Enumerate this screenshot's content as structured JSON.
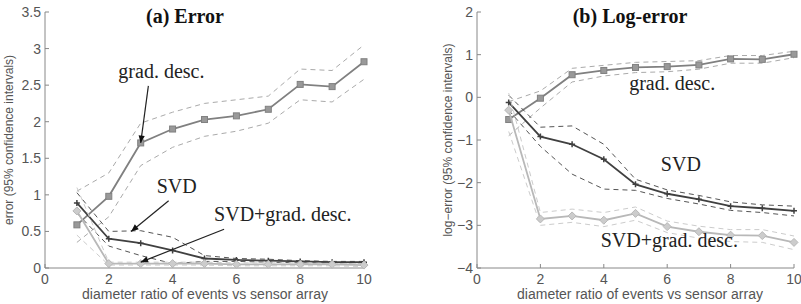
{
  "chart_data": [
    {
      "type": "line",
      "title": "(a) Error",
      "xlabel": "diameter ratio of events vs sensor array",
      "ylabel": "error (95% confidence intervals)",
      "xlim": [
        0,
        10
      ],
      "ylim": [
        0,
        3.5
      ],
      "xticks": [
        "0",
        "2",
        "4",
        "6",
        "8",
        "10"
      ],
      "yticks": [
        "0",
        "0.5",
        "1",
        "1.5",
        "2",
        "2.5",
        "3",
        "3.5"
      ],
      "grid": false,
      "x": [
        1,
        2,
        3,
        4,
        5,
        6,
        7,
        8,
        9,
        10
      ],
      "series": [
        {
          "name": "grad. desc.",
          "marker": "square",
          "color": "#808080",
          "values": [
            0.59,
            0.98,
            1.71,
            1.9,
            2.03,
            2.08,
            2.17,
            2.51,
            2.48,
            2.82
          ],
          "ci_upper": [
            1.05,
            1.3,
            1.98,
            2.13,
            2.25,
            2.3,
            2.35,
            2.72,
            2.7,
            3.05
          ],
          "ci_lower": [
            0.35,
            0.7,
            1.4,
            1.65,
            1.8,
            1.87,
            1.98,
            2.3,
            2.27,
            2.58
          ]
        },
        {
          "name": "SVD",
          "marker": "plus",
          "color": "#404040",
          "values": [
            0.89,
            0.4,
            0.34,
            0.24,
            0.13,
            0.11,
            0.1,
            0.09,
            0.08,
            0.08
          ],
          "ci_upper": [
            1.03,
            0.5,
            0.51,
            0.42,
            0.17,
            0.13,
            0.12,
            0.1,
            0.09,
            0.09
          ],
          "ci_lower": [
            0.75,
            0.3,
            0.17,
            0.06,
            0.09,
            0.09,
            0.08,
            0.07,
            0.07,
            0.07
          ]
        },
        {
          "name": "SVD+grad. desc.",
          "marker": "diamond",
          "color": "#b8b8b8",
          "values": [
            0.78,
            0.06,
            0.06,
            0.06,
            0.06,
            0.05,
            0.05,
            0.05,
            0.05,
            0.04
          ],
          "ci_upper": [
            1.1,
            0.08,
            0.08,
            0.08,
            0.08,
            0.07,
            0.07,
            0.07,
            0.06,
            0.06
          ],
          "ci_lower": [
            0.45,
            0.04,
            0.04,
            0.04,
            0.04,
            0.03,
            0.03,
            0.03,
            0.03,
            0.02
          ]
        }
      ],
      "annotations": [
        {
          "text": "grad. desc.",
          "x": 2.3,
          "y": 2.6,
          "arrow_to": [
            3,
            1.71
          ]
        },
        {
          "text": "SVD",
          "x": 3.5,
          "y": 1.03,
          "arrow_to": [
            2.7,
            0.5
          ]
        },
        {
          "text": "SVD+grad. desc.",
          "x": 5.3,
          "y": 0.64,
          "arrow_to": [
            3,
            0.08
          ]
        }
      ]
    },
    {
      "type": "line",
      "title": "(b) Log-error",
      "xlabel": "diameter ratio of events vs sensor array",
      "ylabel": "log−error (95% confidence intervals)",
      "xlim": [
        0,
        10
      ],
      "ylim": [
        -4,
        2
      ],
      "xticks": [
        "0",
        "2",
        "4",
        "6",
        "8",
        "10"
      ],
      "yticks": [
        "−4",
        "−3",
        "−2",
        "−1",
        "0",
        "1",
        "2"
      ],
      "grid": false,
      "x": [
        1,
        2,
        3,
        4,
        5,
        6,
        7,
        8,
        9,
        10
      ],
      "series": [
        {
          "name": "grad. desc.",
          "marker": "square",
          "color": "#808080",
          "values": [
            -0.52,
            -0.02,
            0.53,
            0.63,
            0.7,
            0.72,
            0.76,
            0.9,
            0.89,
            1.01
          ],
          "ci_upper": [
            -0.1,
            0.15,
            0.68,
            0.75,
            0.82,
            0.84,
            0.86,
            0.98,
            0.98,
            1.08
          ],
          "ci_lower": [
            -0.9,
            -0.25,
            0.36,
            0.5,
            0.58,
            0.6,
            0.66,
            0.8,
            0.8,
            0.93
          ]
        },
        {
          "name": "SVD",
          "marker": "plus",
          "color": "#404040",
          "values": [
            -0.12,
            -0.92,
            -1.1,
            -1.45,
            -2.04,
            -2.26,
            -2.39,
            -2.55,
            -2.6,
            -2.66
          ],
          "ci_upper": [
            0.05,
            -0.7,
            -0.67,
            -1.1,
            -1.92,
            -2.17,
            -2.3,
            -2.45,
            -2.52,
            -2.55
          ],
          "ci_lower": [
            -0.3,
            -1.15,
            -1.8,
            -2.15,
            -2.18,
            -2.37,
            -2.5,
            -2.65,
            -2.7,
            -2.78
          ]
        },
        {
          "name": "SVD+grad. desc.",
          "marker": "diamond",
          "color": "#b8b8b8",
          "values": [
            -0.3,
            -2.85,
            -2.78,
            -2.88,
            -2.72,
            -3.03,
            -3.15,
            -3.23,
            -3.24,
            -3.4
          ],
          "ci_upper": [
            0.1,
            -2.7,
            -2.62,
            -2.7,
            -2.57,
            -2.9,
            -3.02,
            -3.1,
            -3.1,
            -3.25
          ],
          "ci_lower": [
            -0.8,
            -3.0,
            -2.93,
            -3.03,
            -2.88,
            -3.17,
            -3.3,
            -3.38,
            -3.4,
            -3.57
          ]
        }
      ],
      "annotations": [
        {
          "text": "grad. desc.",
          "x": 4.8,
          "y": 0.18
        },
        {
          "text": "SVD",
          "x": 5.8,
          "y": -1.72
        },
        {
          "text": "SVD+grad. desc.",
          "x": 3.9,
          "y": -3.5
        }
      ]
    }
  ]
}
